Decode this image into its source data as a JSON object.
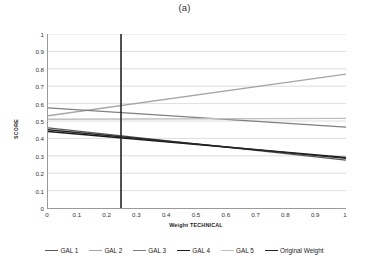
{
  "figure": {
    "title": "(a)"
  },
  "axes": {
    "xlabel": "Weight TECHNICAL",
    "ylabel": "SCORE",
    "yticks": [
      "1",
      "0.9",
      "0.8",
      "0.7",
      "0.6",
      "0.5",
      "0.4",
      "0.3",
      "0.2",
      "0.1",
      "0"
    ],
    "xticks": [
      "0",
      "0.1",
      "0.2",
      "0.3",
      "0.4",
      "0.5",
      "0.6",
      "0.7",
      "0.8",
      "0.9",
      "1"
    ]
  },
  "legend": {
    "items": [
      {
        "label": "GAL 1",
        "color": "#595959"
      },
      {
        "label": "GAL 2",
        "color": "#a6a6a6"
      },
      {
        "label": "GAL 3",
        "color": "#7f7f7f"
      },
      {
        "label": "GAL 4",
        "color": "#1a1a1a"
      },
      {
        "label": "GAL 5",
        "color": "#bfbfbf"
      },
      {
        "label": "Original Weight",
        "color": "#262626"
      }
    ]
  },
  "chart_data": {
    "type": "line",
    "title": "(a)",
    "xlabel": "Weight TECHNICAL",
    "ylabel": "SCORE",
    "xlim": [
      0,
      1
    ],
    "ylim": [
      0,
      1
    ],
    "grid": "horizontal",
    "x": [
      0,
      1
    ],
    "series": [
      {
        "name": "GAL 1",
        "color": "#595959",
        "width": 1.3,
        "values": [
          0.46,
          0.275
        ]
      },
      {
        "name": "GAL 2",
        "color": "#a6a6a6",
        "width": 1.3,
        "values": [
          0.53,
          0.77
        ]
      },
      {
        "name": "GAL 3",
        "color": "#7f7f7f",
        "width": 1.3,
        "values": [
          0.575,
          0.465
        ]
      },
      {
        "name": "GAL 4",
        "color": "#1a1a1a",
        "width": 1.4,
        "values": [
          0.44,
          0.29
        ]
      },
      {
        "name": "GAL 5",
        "color": "#bfbfbf",
        "width": 1.3,
        "values": [
          0.51,
          0.515
        ]
      },
      {
        "name": "Original Weight",
        "color": "#262626",
        "width": 1.4,
        "values": [
          0.45,
          0.285
        ]
      }
    ],
    "reference_line": {
      "name": "Original Weight vertical marker",
      "orientation": "vertical",
      "x": 0.245,
      "y_range": [
        0,
        1
      ],
      "color": "#262626"
    },
    "annotations": [
      "A vertical black line is drawn at Weight TECHNICAL = 0.245 spanning the full SCORE range 0 to 1."
    ]
  }
}
